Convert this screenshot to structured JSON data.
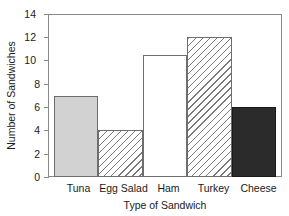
{
  "chart_data": {
    "type": "bar",
    "title": "",
    "xlabel": "Type of Sandwich",
    "ylabel": "Number of Sandwiches",
    "categories": [
      "Tuna",
      "Egg Salad",
      "Ham",
      "Turkey",
      "Cheese"
    ],
    "values": [
      7,
      4,
      10.5,
      12,
      6
    ],
    "series": [
      {
        "name": "Number of Sandwiches",
        "values": [
          7,
          4,
          10.5,
          12,
          6
        ]
      }
    ],
    "bar_styles": [
      "solid-light-gray",
      "diagonal-hatch",
      "white-empty",
      "diagonal-hatch",
      "solid-dark"
    ],
    "ylim": [
      0,
      14
    ],
    "yticks": [
      0,
      2,
      4,
      6,
      8,
      10,
      12,
      14
    ],
    "ytick_labels": [
      "0",
      "2",
      "4",
      "6",
      "8",
      "10",
      "12",
      "14"
    ],
    "grid": false,
    "legend": "none",
    "bar_gap": 0,
    "colors": {
      "solid_light": "#d2d2d2",
      "solid_dark": "#2b2b2b",
      "empty": "#ffffff",
      "hatch_line": "#7a7a7a",
      "axis": "#8a8a8a",
      "bar_outline": "#6e6e6e",
      "text": "#1a1a1a"
    }
  }
}
